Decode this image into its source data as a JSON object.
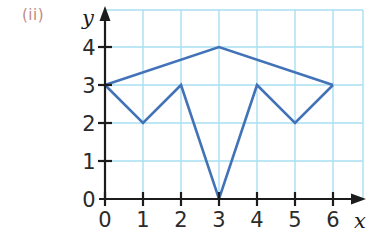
{
  "figure": {
    "part_label": "(ii)",
    "part_label_color": "#c08a84"
  },
  "chart_data": {
    "type": "line",
    "title": "",
    "subtitle": "",
    "xlabel": "x",
    "ylabel": "y",
    "xlim": [
      0,
      6.8
    ],
    "ylim": [
      0,
      4.6
    ],
    "xticks": [
      0,
      1,
      2,
      3,
      4,
      5,
      6
    ],
    "xticklabels": [
      "0",
      "1",
      "2",
      "3",
      "4",
      "5",
      "6"
    ],
    "yticks": [
      0,
      1,
      2,
      3,
      4
    ],
    "yticklabels": [
      "0",
      "1",
      "2",
      "3",
      "4"
    ],
    "grid": true,
    "grid_color": "#a9dff2",
    "legend": "none",
    "line_color": "#4272b8",
    "line_width": 2.6,
    "series": [
      {
        "name": "lower-zigzag",
        "x": [
          0,
          1,
          2,
          3,
          4,
          5,
          6
        ],
        "y": [
          3,
          2,
          3,
          0,
          3,
          2,
          3
        ]
      },
      {
        "name": "upper-roof",
        "x": [
          0,
          3,
          6
        ],
        "y": [
          3,
          4,
          3
        ]
      }
    ],
    "annotations": [],
    "axis_color": "#1c1c1c"
  },
  "tick_labels": {
    "x": [
      "0",
      "1",
      "2",
      "3",
      "4",
      "5",
      "6"
    ],
    "y0": "0",
    "y1": "1",
    "y2": "2",
    "y3": "3",
    "y4": "4"
  },
  "axis_names": {
    "x": "x",
    "y": "y"
  }
}
